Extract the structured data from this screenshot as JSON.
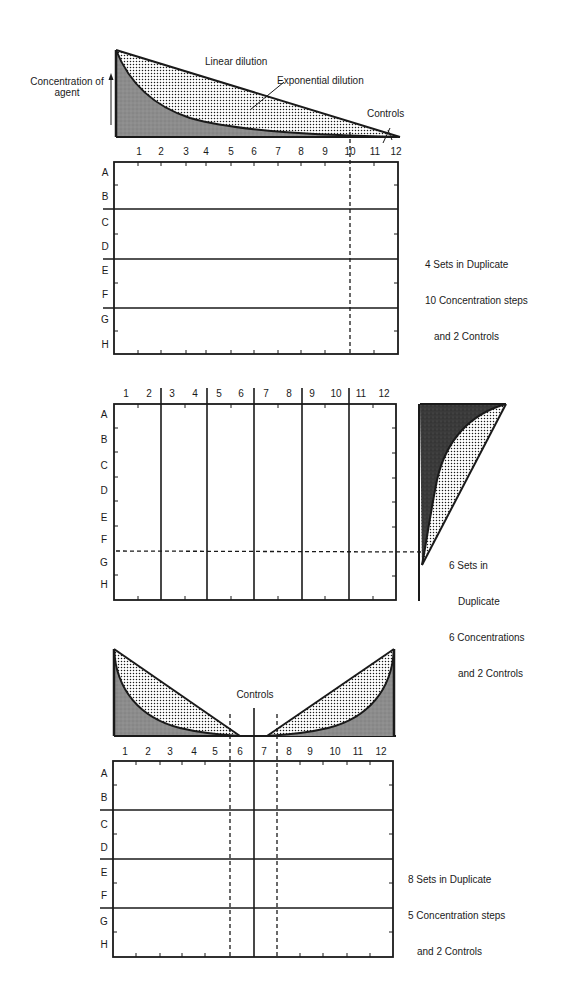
{
  "figure": {
    "panel1": {
      "y_axis_label_line1": "Concentration of",
      "y_axis_label_line2": "agent",
      "curve_labels": {
        "linear": "Linear dilution",
        "exponential": "Exponential dilution",
        "controls": "Controls"
      },
      "columns": [
        "1",
        "2",
        "3",
        "4",
        "5",
        "6",
        "7",
        "8",
        "9",
        "10",
        "11",
        "12"
      ],
      "rows": [
        "A",
        "B",
        "C",
        "D",
        "E",
        "F",
        "G",
        "H"
      ],
      "note_line1": "4 Sets in Duplicate",
      "note_line2": "10 Concentration steps",
      "note_line3": "and 2 Controls"
    },
    "panel2": {
      "columns": [
        "1",
        "2",
        "3",
        "4",
        "5",
        "6",
        "7",
        "8",
        "9",
        "10",
        "11",
        "12"
      ],
      "rows": [
        "A",
        "B",
        "C",
        "D",
        "E",
        "F",
        "G",
        "H"
      ],
      "note_line1": "6 Sets in",
      "note_line2": "Duplicate",
      "note_line3": "6 Concentrations",
      "note_line4": "and 2 Controls"
    },
    "panel3": {
      "controls_label": "Controls",
      "columns": [
        "1",
        "2",
        "3",
        "4",
        "5",
        "6",
        "7",
        "8",
        "9",
        "10",
        "11",
        "12"
      ],
      "rows": [
        "A",
        "B",
        "C",
        "D",
        "E",
        "F",
        "G",
        "H"
      ],
      "note_line1": "8 Sets in Duplicate",
      "note_line2": "5 Concentration steps",
      "note_line3": "and 2 Controls"
    }
  },
  "colors": {
    "ink": "#1a1a1a",
    "shade": "#8c8c8c",
    "dark_shade": "#3a3a3a"
  }
}
